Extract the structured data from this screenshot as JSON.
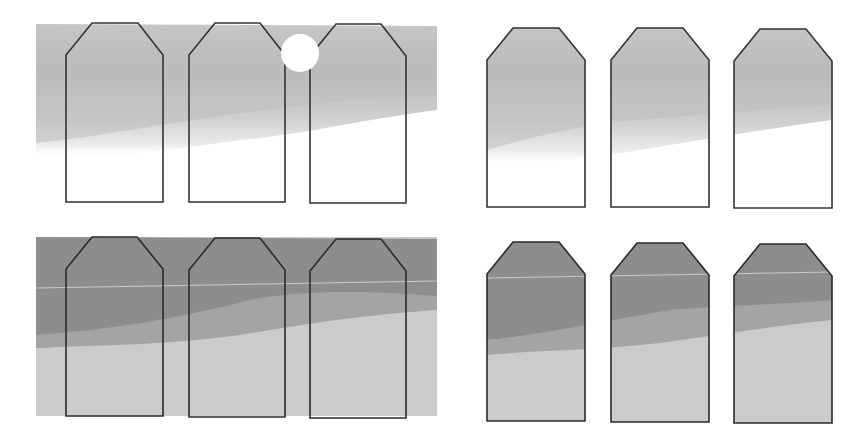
{
  "figure": {
    "panels": [
      {
        "id": "top-left",
        "style": "light-bg-outlined"
      },
      {
        "id": "top-right",
        "style": "light-clipped"
      },
      {
        "id": "bottom-left",
        "style": "dark-bg-outlined"
      },
      {
        "id": "bottom-right",
        "style": "dark-clipped"
      }
    ],
    "tag_count_per_panel": 3,
    "colors": {
      "outline": "#333333",
      "light_top": "#b8b8b8",
      "light_mid": "#c4c4c4",
      "light_fade": "#e6e6e6",
      "dark_top": "#8a8a8a",
      "dark_mid": "#9e9e9e",
      "dark_bottom": "#c9c9c9"
    }
  }
}
